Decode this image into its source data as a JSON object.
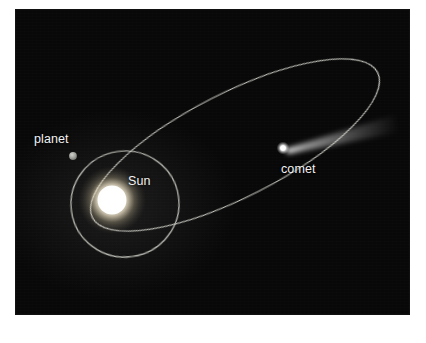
{
  "figure": {
    "name": "comet-orbit-diagram",
    "background_color": "#ffffff",
    "panel_color": "#0a0a0a",
    "panel": {
      "x": 16,
      "y": 10,
      "width": 393,
      "height": 304
    }
  },
  "labels": {
    "planet": "planet",
    "sun": "Sun",
    "comet": "comet"
  },
  "colors": {
    "orbit_line": "#d8d8d0",
    "sun_core": "#ffffff",
    "sun_glow": "#ffeec8",
    "planet_body": "#9a9a98",
    "comet_nucleus": "#ffffff",
    "comet_tail": "#cfcfcf",
    "label_text": "#f2f2f2"
  },
  "objects": {
    "sun": {
      "label": "Sun",
      "center": {
        "x": 96,
        "y": 190
      },
      "core_radius": 16,
      "glow_radius": 34
    },
    "planet": {
      "label": "planet",
      "center": {
        "x": 57,
        "y": 146
      },
      "radius": 3.6
    },
    "comet": {
      "label": "comet",
      "nucleus": {
        "x": 267,
        "y": 138
      },
      "nucleus_radius": 3.2,
      "tail_tip": {
        "x": 377,
        "y": 110
      },
      "tail_width_at_tip": 20
    }
  },
  "orbits": {
    "planet_orbit": {
      "name": "planet-circular-orbit",
      "center": {
        "x": 109,
        "y": 194
      },
      "rx": 54,
      "ry": 53,
      "rotation_deg": -8,
      "stroke_width": 1.2
    },
    "comet_orbit": {
      "name": "comet-elliptical-orbit",
      "center": {
        "x": 219,
        "y": 135
      },
      "rx": 160,
      "ry": 52,
      "rotation_deg": -27,
      "stroke_width": 1.2
    }
  }
}
